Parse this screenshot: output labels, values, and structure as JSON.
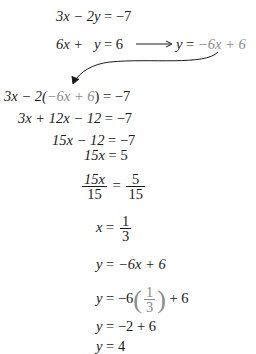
{
  "system": {
    "eq1": {
      "lhs": "3x − 2y",
      "eq": "=",
      "rhs": "−7"
    },
    "eq2": {
      "lhs": "6x +   y",
      "eq": "=",
      "rhs": "6"
    },
    "solved": {
      "lhs": "y",
      "eq": "=",
      "rhs": "−6x + 6"
    }
  },
  "steps": [
    {
      "lhs_a": "3x − 2(",
      "lhs_sub": "−6x + 6",
      "lhs_b": ")",
      "eq": "=",
      "rhs": "−7"
    },
    {
      "lhs": "3x + 12x − 12",
      "eq": "=",
      "rhs": "−7"
    },
    {
      "lhs": "15x − 12",
      "eq": "=",
      "rhs": "−7"
    },
    {
      "lhs": "15x",
      "eq": "=",
      "rhs": "5"
    },
    {
      "lhs_num": "15x",
      "lhs_den": "15",
      "eq": "=",
      "rhs_num": "5",
      "rhs_den": "15"
    },
    {
      "lhs": "x",
      "eq": "=",
      "rhs_num": "1",
      "rhs_den": "3"
    },
    {
      "lhs": "y",
      "eq": "=",
      "rhs": "−6x + 6"
    },
    {
      "lhs": "y",
      "eq": "=",
      "rhs_a": "−6",
      "rhs_num": "1",
      "rhs_den": "3",
      "rhs_b": "+ 6"
    },
    {
      "lhs": "y",
      "eq": "=",
      "rhs": "−2 + 6"
    },
    {
      "lhs": "y",
      "eq": "=",
      "rhs": "4"
    }
  ],
  "colors": {
    "text": "#1a1a1a",
    "substituted": "#8a8a8a"
  }
}
